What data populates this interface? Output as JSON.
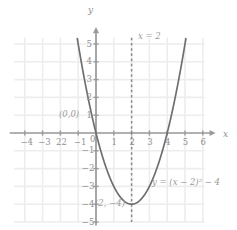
{
  "chart_data": {
    "type": "line",
    "title": "",
    "xlabel": "x",
    "ylabel": "y",
    "xlim": [
      -4.6,
      6.6
    ],
    "ylim": [
      -5.4,
      5.4
    ],
    "grid": true,
    "legend": "none",
    "equation_label": "y = (x − 2)² − 4",
    "series": [
      {
        "name": "y = (x − 2)² − 4",
        "type": "parabola",
        "vertex": [
          2,
          -4
        ],
        "a": 1,
        "x": [
          -1.0,
          -0.8,
          -0.6,
          -0.4,
          -0.2,
          0.0,
          0.25,
          0.5,
          0.75,
          1.0,
          1.25,
          1.5,
          1.75,
          2.0,
          2.25,
          2.5,
          2.75,
          3.0,
          3.25,
          3.5,
          3.75,
          4.0,
          4.2,
          4.4,
          4.6,
          4.8,
          5.0
        ],
        "y": [
          5.0,
          3.84,
          2.76,
          1.76,
          0.84,
          0.0,
          -1.4375,
          -2.25,
          -2.4375,
          -3.0,
          -3.4375,
          -3.75,
          -3.9375,
          -4.0,
          -3.9375,
          -3.75,
          -3.4375,
          -3.0,
          -2.4375,
          -1.75,
          -0.9375,
          0.0,
          0.84,
          1.76,
          2.76,
          3.84,
          5.0
        ],
        "color": "#6f6f6f"
      }
    ],
    "axis_of_symmetry": {
      "label": "x = 2",
      "x": 2,
      "style": "dashed",
      "color": "#8a8a8a"
    },
    "points": [
      {
        "label": "(0,0)",
        "x": 0,
        "y": 0
      },
      {
        "label": "(2, −4)",
        "x": 2,
        "y": -4
      }
    ],
    "x_ticks": [
      {
        "value": -4,
        "label": "−4"
      },
      {
        "value": -3,
        "label": "−3"
      },
      {
        "value": -2,
        "label": "22"
      },
      {
        "value": -1,
        "label": "−1"
      },
      {
        "value": 1,
        "label": "1"
      },
      {
        "value": 2,
        "label": "2"
      },
      {
        "value": 3,
        "label": "3"
      },
      {
        "value": 4,
        "label": "4"
      },
      {
        "value": 5,
        "label": "5"
      },
      {
        "value": 6,
        "label": "6"
      }
    ],
    "y_ticks": [
      {
        "value": 5,
        "label": "5"
      },
      {
        "value": 4,
        "label": "4"
      },
      {
        "value": 3,
        "label": "3"
      },
      {
        "value": 2,
        "label": "2"
      },
      {
        "value": 1,
        "label": "1"
      },
      {
        "value": -1,
        "label": "−1"
      },
      {
        "value": -2,
        "label": "−2"
      },
      {
        "value": -3,
        "label": "−3"
      },
      {
        "value": -4,
        "label": "−4"
      },
      {
        "value": -5,
        "label": "−5"
      }
    ],
    "origin_label": "0",
    "colors": {
      "grid": "#ededed",
      "axis": "#9a9a9a",
      "curve": "#6f6f6f",
      "dashed": "#8a8a8a",
      "text": "#8f8f8f",
      "background": "#ffffff"
    }
  }
}
